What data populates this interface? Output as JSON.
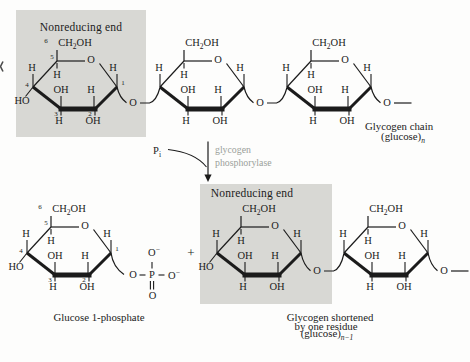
{
  "boxes": {
    "nonreducing_end": "Nonreducing end"
  },
  "labels": {
    "h": "H",
    "oh": "OH",
    "ho": "HO",
    "o": "O",
    "ch": "CH",
    "two": "2",
    "p": "P",
    "i": "i",
    "minus": "−",
    "n1": "1",
    "n2": "2",
    "n3": "3",
    "n4": "4",
    "n5": "5",
    "n6": "6"
  },
  "reaction": {
    "plus": "+",
    "enzyme_line1": "glycogen",
    "enzyme_line2": "phosphorylase"
  },
  "captions": {
    "glycogen_chain": "Glycogen chain",
    "glucose_n_pre": "(glucose)",
    "glucose_n_sub": "n",
    "glucose_1_phosphate": "Glucose 1-phosphate",
    "shortened_1": "Glycogen shortened",
    "shortened_2": "by one residue",
    "shortened_n_pre": "(glucose)",
    "shortened_n_sub": "n−1"
  },
  "colors": {
    "background": "#fdfdfc",
    "shaded_box": "#d8d8d4",
    "ink": "#1b1b1b",
    "enzyme_text": "#9aa09a"
  }
}
